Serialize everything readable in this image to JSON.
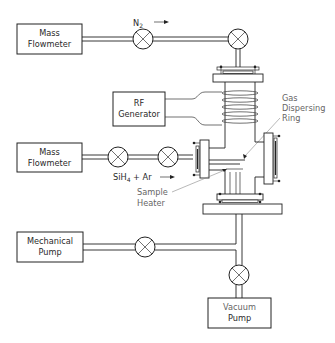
{
  "diagram": {
    "title": "",
    "components": {
      "mass_flowmeter_top": {
        "line1": "Mass",
        "line2": "Flowmeter"
      },
      "mass_flowmeter_mid": {
        "line1": "Mass",
        "line2": "Flowmeter"
      },
      "rf_generator": {
        "line1": "RF",
        "line2": "Generator"
      },
      "mechanical_pump": {
        "line1": "Mechanical",
        "line2": "Pump"
      },
      "vacuum_pump": {
        "line1": "Vacuum",
        "line2": "Pump"
      }
    },
    "labels": {
      "n2": "N",
      "n2_sub": "2",
      "silane_gas": "SiH",
      "silane_sub": "4",
      "silane_rest": " + Ar",
      "gas_ring_1": "Gas",
      "gas_ring_2": "Dispersing",
      "gas_ring_3": "Ring",
      "heater_1": "Sample",
      "heater_2": "Heater"
    },
    "flow_arrows": [
      "N2 flow right",
      "SiH4 + Ar flow right"
    ],
    "valves": [
      {
        "id": "n2-valve-1"
      },
      {
        "id": "n2-valve-2"
      },
      {
        "id": "silane-valve-1"
      },
      {
        "id": "silane-valve-2"
      },
      {
        "id": "mechanical-pump-valve"
      },
      {
        "id": "vacuum-pump-valve"
      }
    ],
    "colors": {
      "line": "#222222",
      "background": "#ffffff"
    }
  }
}
